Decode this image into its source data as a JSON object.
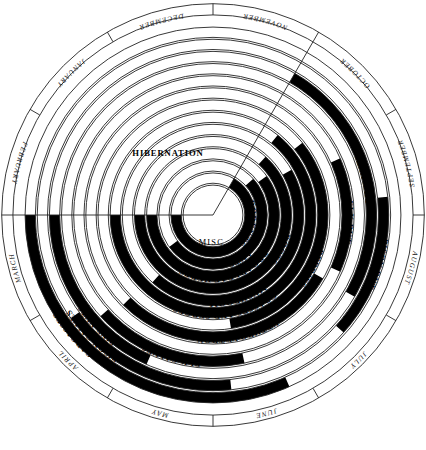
{
  "center": {
    "label": "MISC."
  },
  "hibernation": {
    "label": "HIBERNATION"
  },
  "months": {
    "direction": "counterclockwise",
    "items": [
      {
        "name": "DECEMBER",
        "index": 0
      },
      {
        "name": "JANUARY",
        "index": 1
      },
      {
        "name": "FEBRUARY",
        "index": 2
      },
      {
        "name": "MARCH",
        "index": 3
      },
      {
        "name": "APRIL",
        "index": 4
      },
      {
        "name": "MAY",
        "index": 5
      },
      {
        "name": "JUNE",
        "index": 6
      },
      {
        "name": "JULY",
        "index": 7
      },
      {
        "name": "AUGUST",
        "index": 8
      },
      {
        "name": "SEPTEMBER",
        "index": 9
      },
      {
        "name": "OCTOBER",
        "index": 10
      },
      {
        "name": "NOVEMBER",
        "index": 11
      }
    ]
  },
  "chart_data": {
    "type": "radial-gantt",
    "categories": [
      "DECEMBER",
      "JANUARY",
      "FEBRUARY",
      "MARCH",
      "APRIL",
      "MAY",
      "JUNE",
      "JULY",
      "AUGUST",
      "SEPTEMBER",
      "OCTOBER",
      "NOVEMBER"
    ],
    "angle_direction": "counterclockwise",
    "angle_start_deg": 90,
    "legend": {
      "black": "food available / activity occurring",
      "white": "not available"
    },
    "rings": [
      {
        "ring": 0,
        "label": "MISC.",
        "r_in": 0,
        "r_out": 32,
        "spans": []
      },
      {
        "ring": 1,
        "label": "RODENTS",
        "r_in": 34,
        "r_out": 45,
        "spans": [
          [
            3.0,
            11.0
          ]
        ]
      },
      {
        "ring": 2,
        "label": "ANTS",
        "r_in": 47,
        "r_out": 58,
        "spans": [
          [
            4.2,
            10.4
          ]
        ]
      },
      {
        "ring": 3,
        "label": "BROADLEAF HERBS",
        "r_in": 60,
        "r_out": 71,
        "spans": [
          [
            3.0,
            10.2
          ]
        ]
      },
      {
        "ring": 4,
        "label": "ROOTS",
        "r_in": 73,
        "r_out": 84,
        "spans": [
          [
            3.0,
            10.6
          ]
        ]
      },
      {
        "ring": 5,
        "label": "MUSHROOMS",
        "r_in": 86,
        "r_out": 97,
        "spans": [
          [
            4.6,
            10.0
          ]
        ]
      },
      {
        "ring": 6,
        "label": "GRASSES AND SEDGES",
        "r_in": 99,
        "r_out": 110,
        "spans": [
          [
            3.0,
            10.7
          ]
        ]
      },
      {
        "ring": 7,
        "label": "BERRIES",
        "r_in": 112,
        "r_out": 123,
        "spans": [
          [
            6.3,
            10.3
          ]
        ]
      },
      {
        "ring": 8,
        "label": "CUTTHROAT TROUT",
        "r_in": 125,
        "r_out": 136,
        "spans": [
          [
            4.5,
            8.0
          ]
        ]
      },
      {
        "ring": 9,
        "label": "ELK RUT",
        "r_in": 138,
        "r_out": 149,
        "spans": [
          [
            8.2,
            9.8
          ]
        ]
      },
      {
        "ring": 10,
        "label": "ELK CALVES",
        "r_in": 151,
        "r_out": 162,
        "spans": [
          [
            4.4,
            6.4
          ]
        ]
      },
      {
        "ring": 11,
        "label": "PINE NUTS",
        "r_in": 164,
        "r_out": 175,
        "spans": [
          [
            3.0,
            5.2
          ],
          [
            8.0,
            11.0
          ]
        ]
      },
      {
        "ring": 12,
        "label": "BISON CALVES",
        "r_in": 177,
        "r_out": 188,
        "spans": [
          [
            4.2,
            6.2
          ]
        ]
      },
      {
        "ring": 13,
        "label": "BISON RUT",
        "r_in": 177,
        "r_out": 188,
        "spans": [
          [
            7.6,
            9.2
          ]
        ]
      },
      {
        "ring": 14,
        "label": "CARCASSES",
        "r_in": 190,
        "r_out": 201,
        "spans": [
          [
            3.0,
            6.8
          ]
        ]
      }
    ],
    "ring_labels_order_outward": [
      "MISC.",
      "RODENTS",
      "ANTS",
      "BROADLEAF HERBS",
      "ROOTS",
      "MUSHROOMS",
      "GRASSES AND SEDGES",
      "CUTTHROAT TROUT",
      "BERRIES",
      "ELK CALVES",
      "ELK RUT",
      "PINE NUTS",
      "BISON CALVES",
      "BISON RUT",
      "CARCASSES"
    ]
  },
  "food_labels": [
    {
      "key": "rodents",
      "text": "RODENTS"
    },
    {
      "key": "ants",
      "text": "ANTS"
    },
    {
      "key": "herbs",
      "text": "BROADLEAF HERBS"
    },
    {
      "key": "roots",
      "text": "ROOTS"
    },
    {
      "key": "mushrooms",
      "text": "MUSHROOMS"
    },
    {
      "key": "grasses",
      "text": "GRASSES AND SEDGES"
    },
    {
      "key": "berries",
      "text": "BERRIES"
    },
    {
      "key": "trout",
      "text": "CUTTHROAT TROUT"
    },
    {
      "key": "elkrut",
      "text": "ELK RUT"
    },
    {
      "key": "elkcalves",
      "text": "ELK CALVES"
    },
    {
      "key": "pinenuts",
      "text": "PINE NUTS"
    },
    {
      "key": "pinenuts2",
      "text": "PINE NUTS"
    },
    {
      "key": "bisonrut",
      "text": "BISON RUT"
    },
    {
      "key": "bisoncalves",
      "text": "BISON CALVES"
    },
    {
      "key": "carcasses",
      "text": "CARCASSES"
    }
  ],
  "colors": {
    "ink": "#111111",
    "fill_black": "#000000",
    "fill_white": "#ffffff",
    "background": "#ffffff"
  }
}
